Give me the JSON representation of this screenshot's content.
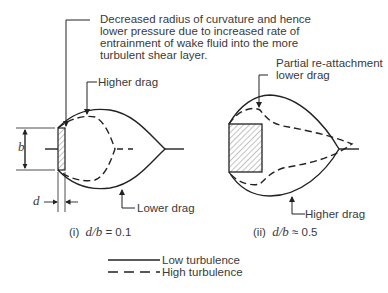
{
  "annotation_top": {
    "lines": [
      "Decreased radius of curvature and hence",
      "lower pressure due to increased rate of",
      "entrainment of wake fluid into the more",
      "turbulent shear layer."
    ]
  },
  "left_diagram": {
    "label_higher_drag": "Higher drag",
    "label_lower_drag": "Lower drag",
    "dim_b": "b",
    "dim_d": "d",
    "caption_prefix": "(i)",
    "caption_ratio": "d/b",
    "caption_value": "= 0.1"
  },
  "right_diagram": {
    "label_partial": [
      "Partial re-attachment",
      "lower drag"
    ],
    "label_higher_drag": "Higher drag",
    "caption_prefix": "(ii)",
    "caption_ratio": "d/b",
    "caption_value": "≈ 0.5"
  },
  "legend": {
    "items": [
      {
        "style": "solid",
        "label": "Low turbulence"
      },
      {
        "style": "dashed",
        "label": "High turbulence"
      }
    ]
  }
}
